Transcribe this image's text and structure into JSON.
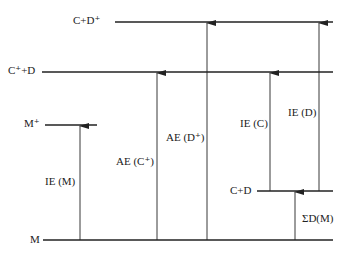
{
  "diagram": {
    "type": "energy-level-diagram",
    "levels": [
      {
        "id": "cd_plus",
        "label": "C+D⁺",
        "y": 22,
        "x1": 115,
        "x2": 333
      },
      {
        "id": "c_plus_d",
        "label": "C⁺+D",
        "y": 72,
        "x1": 42,
        "x2": 333
      },
      {
        "id": "m_plus",
        "label": "M⁺",
        "y": 125,
        "x1": 45,
        "x2": 97
      },
      {
        "id": "c_d",
        "label": "C+D",
        "y": 191,
        "x1": 257,
        "x2": 333
      },
      {
        "id": "m",
        "label": "M",
        "y": 240,
        "x1": 43,
        "x2": 333
      }
    ],
    "arrows": [
      {
        "id": "ie_m",
        "label": "IE (M)",
        "x": 80,
        "from": 240,
        "to": 125
      },
      {
        "id": "ae_c",
        "label": "AE (C⁺)",
        "x": 157,
        "from": 240,
        "to": 72
      },
      {
        "id": "ae_d",
        "label": "AE (D⁺)",
        "x": 207,
        "from": 240,
        "to": 22
      },
      {
        "id": "ie_c",
        "label": "IE (C)",
        "x": 270,
        "from": 191,
        "to": 72
      },
      {
        "id": "ie_d",
        "label": "IE (D)",
        "x": 319,
        "from": 191,
        "to": 22
      },
      {
        "id": "sum_d",
        "label": "ΣD(M)",
        "x": 295,
        "from": 240,
        "to": 191
      }
    ]
  },
  "labels": {
    "cd_plus": "C+D⁺",
    "c_plus_d": "C⁺+D",
    "m_plus": "M⁺",
    "c_d": "C+D",
    "m": "M",
    "ie_m": "IE (M)",
    "ae_c": "AE (C⁺)",
    "ae_d": "AE (D⁺)",
    "ie_c": "IE (C)",
    "ie_d": "IE (D)",
    "sum_d": "ΣD(M)"
  },
  "colors": {
    "line": "#222222",
    "background": "#ffffff"
  }
}
